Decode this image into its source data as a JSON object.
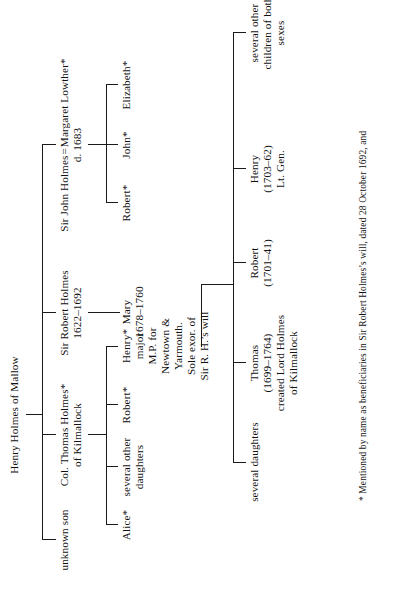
{
  "document": {
    "type": "genealogical-family-tree",
    "orientation": "rotated-90-counter-clockwise",
    "root": "Henry Holmes of Mallow"
  },
  "tree": {
    "generation1": {
      "root_label": "Henry Holmes of Mallow"
    },
    "generation2": [
      {
        "id": "unknown-son",
        "name": "unknown son"
      },
      {
        "id": "col-thomas-holmes",
        "name": "Col. Thomas Holmes*",
        "detail": "of Kilmallock"
      },
      {
        "id": "sir-robert-holmes",
        "name": "Sir Robert Holmes",
        "dates": "1622–1692"
      },
      {
        "id": "sir-john-holmes",
        "name": "Sir John Holmes",
        "spouse_sign": "=",
        "spouse": "Margaret Lowther*",
        "dates": "d. 1683"
      }
    ],
    "generation3_thomas_children": [
      {
        "id": "alice",
        "name": "Alice*"
      },
      {
        "id": "several-other-daughters",
        "name": "several other",
        "detail": "daughters"
      },
      {
        "id": "robert-3",
        "name": "Robert*"
      },
      {
        "id": "henry-3",
        "name": "Henry*",
        "lines": [
          "major",
          "M.P. for",
          "Newtown &",
          "Yarmouth.",
          "Sole exor. of",
          "Sir R. H.’s will"
        ]
      }
    ],
    "generation3_robert_child": {
      "id": "mary",
      "name": "Mary",
      "dates": "1678–1760"
    },
    "generation3_john_children": [
      {
        "id": "robert-john-child",
        "name": "Robert*"
      },
      {
        "id": "john-john-child",
        "name": "John*"
      },
      {
        "id": "elizabeth-john-child",
        "name": "Elizabeth*"
      }
    ],
    "generation4": [
      {
        "id": "several-daughters",
        "name": "several daughters"
      },
      {
        "id": "thomas-4",
        "name": "Thomas",
        "dates": "(1699–1764)",
        "lines": [
          "created Lord Holmes",
          "of Kilmallock"
        ]
      },
      {
        "id": "robert-4",
        "name": "Robert",
        "dates": "(1701–41)"
      },
      {
        "id": "henry-4",
        "name": "Henry",
        "dates": "(1703–62)",
        "lines": [
          "Lt. Gen."
        ]
      },
      {
        "id": "several-other-children",
        "name": "several other",
        "lines": [
          "children of both",
          "sexes"
        ]
      }
    ]
  },
  "footnote": {
    "marker": "*",
    "text": "Mentioned by name as beneficiaries in Sir Robert Holmes’s will, dated 28 October 1692, and"
  },
  "symbols": {
    "marriage": "=",
    "asterisk": "*"
  },
  "colors": {
    "ink": "#111111",
    "rule": "#1a1a1a",
    "paper": "#ffffff"
  }
}
